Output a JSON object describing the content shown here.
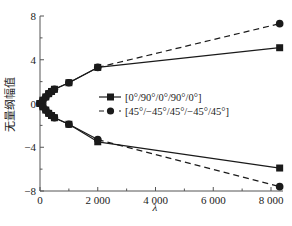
{
  "chart_data": {
    "type": "line",
    "title": "",
    "xlabel": "λ",
    "ylabel": "无量纲幅值",
    "xlim": [
      0,
      8500
    ],
    "ylim": [
      -8,
      8
    ],
    "x_ticks": [
      0,
      2000,
      4000,
      6000,
      8000
    ],
    "x_tick_labels": [
      "0",
      "2 000",
      "4 000",
      "6 000",
      "8 000"
    ],
    "y_ticks": [
      8,
      4,
      0,
      -4,
      -8
    ],
    "y_tick_labels": [
      "8",
      "4",
      "0",
      "−4",
      "−8"
    ],
    "grid": false,
    "legend_position": "center-right",
    "series": [
      {
        "name": "[0°/90°/0°/90°/0°]",
        "marker": "square",
        "line_style": "solid",
        "branch": "upper",
        "x": [
          0,
          100,
          200,
          300,
          400,
          500,
          1000,
          2000,
          8300
        ],
        "y": [
          0,
          0.3,
          0.6,
          0.9,
          1.1,
          1.3,
          1.9,
          3.3,
          5.1
        ]
      },
      {
        "name": "[0°/90°/0°/90°/0°]",
        "marker": "square",
        "line_style": "solid",
        "branch": "lower",
        "x": [
          0,
          100,
          200,
          300,
          400,
          500,
          1000,
          2000,
          8300
        ],
        "y": [
          0,
          -0.3,
          -0.6,
          -0.9,
          -1.1,
          -1.3,
          -1.9,
          -3.5,
          -5.9
        ]
      },
      {
        "name": "[45°/−45°/45°/−45°/45°]",
        "marker": "circle",
        "line_style": "dashed",
        "branch": "upper",
        "x": [
          0,
          100,
          200,
          300,
          400,
          500,
          1000,
          2000,
          8300
        ],
        "y": [
          0,
          0.3,
          0.6,
          0.9,
          1.1,
          1.3,
          1.9,
          3.3,
          7.3
        ]
      },
      {
        "name": "[45°/−45°/45°/−45°/45°]",
        "marker": "circle",
        "line_style": "dashed",
        "branch": "lower",
        "x": [
          0,
          100,
          200,
          300,
          400,
          500,
          1000,
          2000,
          8300
        ],
        "y": [
          0,
          -0.3,
          -0.6,
          -0.9,
          -1.1,
          -1.3,
          -1.9,
          -3.3,
          -7.6
        ]
      }
    ]
  },
  "legend": {
    "items": [
      {
        "label": "[0°/90°/0°/90°/0°]",
        "marker": "square",
        "line_style": "solid"
      },
      {
        "label": "[45°/−45°/45°/−45°/45°]",
        "marker": "circle",
        "line_style": "dashed"
      }
    ]
  },
  "axes": {
    "x_title": "λ",
    "y_title": "无量纲幅值"
  },
  "colors": {
    "line": "#1a1a1a",
    "axis": "#555555",
    "background": "#ffffff"
  }
}
